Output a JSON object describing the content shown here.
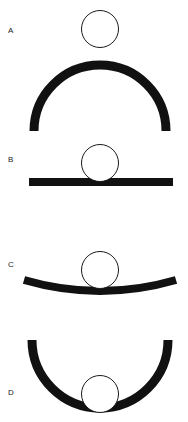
{
  "figure": {
    "background_color": "#ffffff",
    "stroke_color": "#111111",
    "ball_outline_color": "#1a1a1a",
    "ball_fill_color": "#ffffff",
    "width": 188,
    "height": 422
  },
  "panels": [
    {
      "label": "A",
      "surface_name": "convex-dome-surface",
      "surface_description": "thick semicircular arc curving downward (convex dome), ball resting on top of the apex",
      "curvature": "convex",
      "ball": {
        "cx": 100,
        "cy": 29,
        "r": 19
      },
      "arc": {
        "left_x": 30,
        "right_x": 170,
        "apex_y": 60,
        "end_y": 131,
        "radius": 70,
        "thickness": 9
      }
    },
    {
      "label": "B",
      "surface_name": "flat-surface",
      "surface_description": "thick straight horizontal bar (flat surface), ball resting on top",
      "curvature": "flat",
      "ball": {
        "cx": 100,
        "cy": 163,
        "r": 19
      },
      "bar": {
        "left_x": 29,
        "right_x": 173,
        "top_y": 178,
        "thickness": 8
      }
    },
    {
      "label": "C",
      "surface_name": "shallow-concave-surface",
      "surface_description": "thick shallow arc curving slightly upward at the ends (gently concave), ball resting in the shallow dip",
      "curvature": "shallow-concave",
      "ball": {
        "cx": 100,
        "cy": 270,
        "r": 19
      },
      "arc": {
        "left_x": 24,
        "right_x": 176,
        "end_y": 280,
        "lowest_y": 291,
        "sagitta": 11,
        "thickness": 8
      }
    },
    {
      "label": "D",
      "surface_name": "deep-concave-bowl-surface",
      "surface_description": "thick semicircular arc curving upward (deep concave bowl), ball resting at the bottom of the bowl",
      "curvature": "deep-concave",
      "ball": {
        "cx": 100,
        "cy": 394,
        "r": 19
      },
      "arc": {
        "left_x": 28,
        "right_x": 172,
        "top_y": 340,
        "bottom_y": 415,
        "radius": 72,
        "thickness": 9
      }
    }
  ]
}
